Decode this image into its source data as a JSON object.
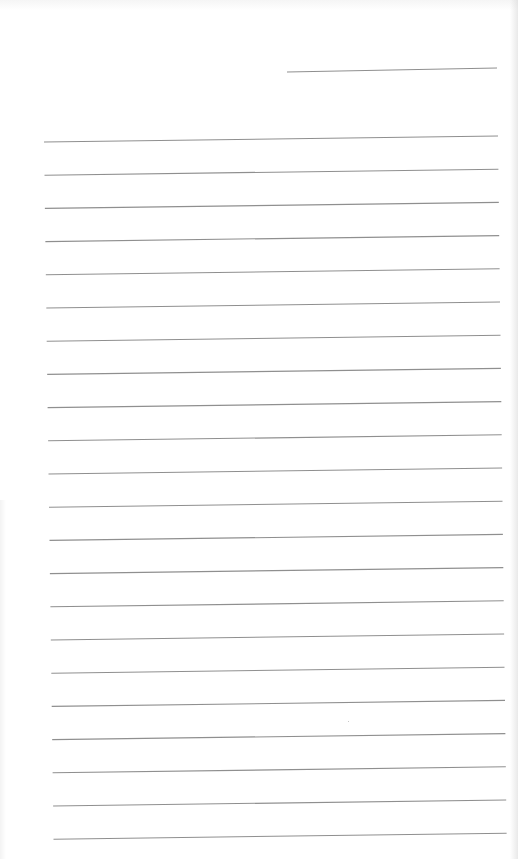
{
  "document": {
    "type": "lined-blank-page",
    "handwritten_text": [],
    "colors": {
      "paper": "#ffffff",
      "rule": "#8f8f8f"
    },
    "header_line": {
      "x1": 287,
      "y1": 72,
      "x2": 497,
      "y2": 68
    },
    "ruled_lines": {
      "count": 23,
      "first_y": 142,
      "spacing": 33.2,
      "left_x_start": 44,
      "left_x_end": 54,
      "right_x_start": 498,
      "right_x_end": 507,
      "tilt": -6
    }
  }
}
